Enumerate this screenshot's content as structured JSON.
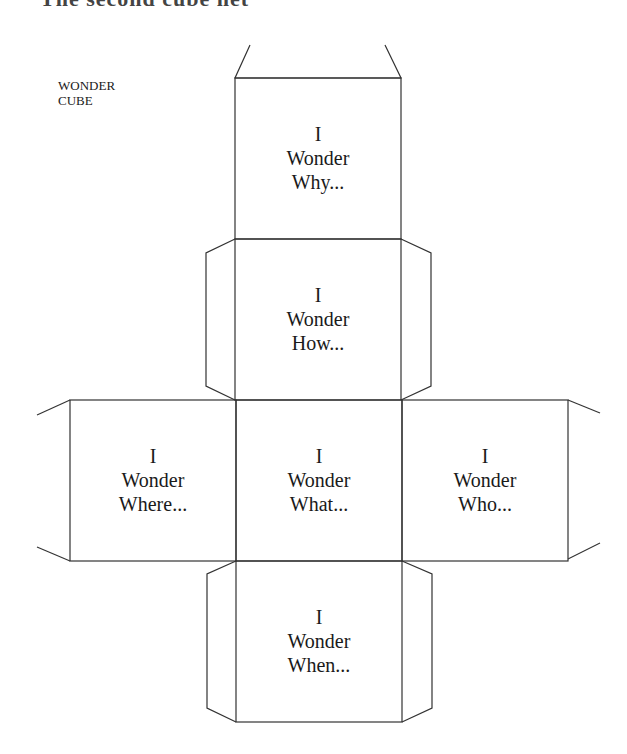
{
  "heading": "The second cube net",
  "label": {
    "line1": "WONDER",
    "line2": "CUBE"
  },
  "colors": {
    "line": "#333333",
    "text": "#1a1a1a",
    "background": "#ffffff"
  },
  "faces": {
    "top": {
      "line1": "I",
      "line2": "Wonder",
      "line3": "Why..."
    },
    "upper": {
      "line1": "I",
      "line2": "Wonder",
      "line3": "How..."
    },
    "left": {
      "line1": "I",
      "line2": "Wonder",
      "line3": "Where..."
    },
    "center": {
      "line1": "I",
      "line2": "Wonder",
      "line3": "What..."
    },
    "right": {
      "line1": "I",
      "line2": "Wonder",
      "line3": "Who..."
    },
    "bottom": {
      "line1": "I",
      "line2": "Wonder",
      "line3": "When..."
    }
  }
}
